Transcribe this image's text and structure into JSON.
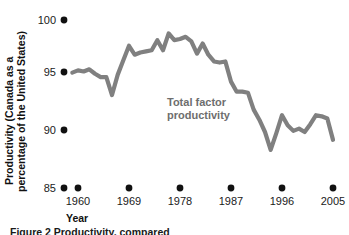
{
  "chart_data": {
    "type": "line",
    "title": "",
    "xlabel": "Year",
    "ylabel": "Productivity (Canada as a percentage of the United States)",
    "ylabel_line1": "Productivity (Canada as a",
    "ylabel_line2": "percentage of the United States)",
    "xlim": [
      1959,
      2004
    ],
    "ylim": [
      85,
      100
    ],
    "grid": false,
    "legend": "none",
    "yticks": [
      85,
      90,
      95,
      100
    ],
    "ytick_labels": [
      "85",
      "90",
      "95",
      "100"
    ],
    "xticks": [
      1960,
      1969,
      1978,
      1987,
      1996,
      2005
    ],
    "xtick_labels": [
      "1960",
      "1969",
      "1978",
      "1987",
      "1996",
      "2005"
    ],
    "series_name": "Total factor productivity",
    "annotation": {
      "line1": "Total factor",
      "line2": "productivity",
      "color": "#6e6e6e"
    },
    "line_color": "#808080",
    "x": [
      1959,
      1960,
      1961,
      1962,
      1963,
      1964,
      1965,
      1966,
      1967,
      1968,
      1969,
      1970,
      1971,
      1972,
      1973,
      1974,
      1975,
      1976,
      1977,
      1978,
      1979,
      1980,
      1981,
      1982,
      1983,
      1984,
      1985,
      1986,
      1987,
      1988,
      1989,
      1990,
      1991,
      1992,
      1993,
      1994,
      1995,
      1996,
      1997,
      1998,
      1999,
      2000,
      2001,
      2002,
      2003,
      2004
    ],
    "values": [
      95.3,
      95.5,
      95.4,
      95.6,
      95.2,
      94.9,
      94.9,
      93.3,
      95.1,
      96.4,
      97.7,
      96.9,
      97.1,
      97.2,
      97.3,
      98.2,
      97.3,
      98.8,
      98.2,
      98.3,
      98.5,
      98.1,
      97.0,
      97.9,
      96.9,
      96.3,
      96.2,
      96.3,
      94.5,
      93.6,
      93.6,
      93.5,
      92.0,
      91.1,
      90.0,
      88.4,
      89.9,
      91.5,
      90.6,
      90.1,
      90.3,
      90.0,
      90.7,
      91.5,
      91.4,
      91.2
    ],
    "value_last": 89.3,
    "caption_partial": "Figure 2 Productivity, compared"
  },
  "figure": {
    "background": "#ffffff"
  }
}
